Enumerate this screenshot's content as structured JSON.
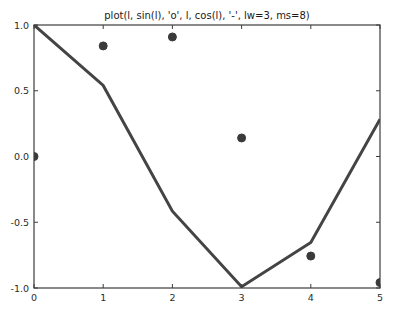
{
  "figure": {
    "background_color": "#ffffff",
    "width": 401,
    "height": 314
  },
  "chart_data": {
    "type": "scatter",
    "title": "plot(l, sin(l), 'o', l, cos(l), '-', lw=3, ms=8)",
    "xlabel": "",
    "ylabel": "",
    "x": [
      0,
      1,
      2,
      3,
      4,
      5
    ],
    "xlim": [
      0,
      5
    ],
    "ylim": [
      -1.0,
      1.0
    ],
    "xticks": [
      0,
      1,
      2,
      3,
      4,
      5
    ],
    "yticks": [
      -1.0,
      -0.5,
      0.0,
      0.5,
      1.0
    ],
    "xticklabels": [
      "0",
      "1",
      "2",
      "3",
      "4",
      "5"
    ],
    "yticklabels": [
      "-1.0",
      "-0.5",
      "0.0",
      "0.5",
      "1.0"
    ],
    "grid": false,
    "legend": null,
    "tick_direction": "in",
    "series": [
      {
        "name": "sin(l)",
        "style": "o",
        "marker": "circle",
        "markersize": 8,
        "linestyle": "none",
        "color": "#3a3a3a",
        "values": [
          0.0,
          0.841,
          0.909,
          0.141,
          -0.757,
          -0.959
        ]
      },
      {
        "name": "cos(l)",
        "style": "-",
        "marker": "none",
        "linewidth": 3,
        "linestyle": "solid",
        "color": "#444444",
        "values": [
          1.0,
          0.54,
          -0.416,
          -0.99,
          -0.654,
          0.284
        ]
      }
    ],
    "axes_color": "#3c3c3c"
  }
}
